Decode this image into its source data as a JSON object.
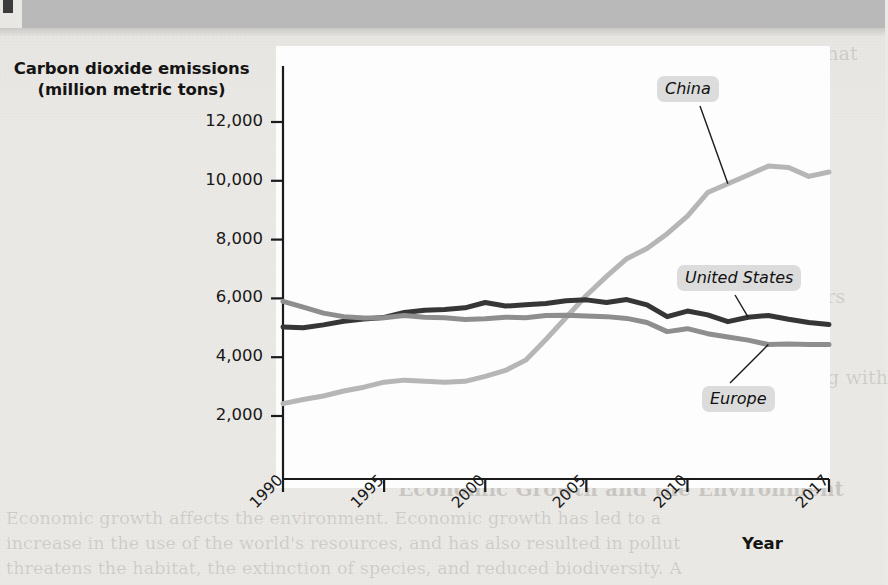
{
  "figure": {
    "y_axis_title": "Carbon dioxide emissions\n(million metric tons)",
    "y_axis_title_line1": "Carbon dioxide emissions",
    "y_axis_title_line2": "(million metric tons)",
    "x_axis_title": "Year"
  },
  "chart_data": {
    "type": "line",
    "title": "",
    "xlabel": "Year",
    "ylabel": "Carbon dioxide emissions (million metric tons)",
    "xlim": [
      1990,
      2017
    ],
    "ylim": [
      0,
      13000
    ],
    "yticks": [
      2000,
      4000,
      6000,
      8000,
      10000,
      12000
    ],
    "ytick_labels": [
      "2,000",
      "4,000",
      "6,000",
      "8,000",
      "10,000",
      "12,000"
    ],
    "xticks": [
      1990,
      1995,
      2000,
      2005,
      2010,
      2017
    ],
    "xtick_labels": [
      "1990",
      "1995",
      "2000",
      "2005",
      "2010",
      "2017"
    ],
    "grid": false,
    "legend_position": "inline-callouts",
    "x": [
      1990,
      1991,
      1992,
      1993,
      1994,
      1995,
      1996,
      1997,
      1998,
      1999,
      2000,
      2001,
      2002,
      2003,
      2004,
      2005,
      2006,
      2007,
      2008,
      2009,
      2010,
      2011,
      2012,
      2013,
      2014,
      2015,
      2016,
      2017
    ],
    "series": [
      {
        "name": "China",
        "color": "#b6b6b6",
        "values": [
          2420,
          2560,
          2680,
          2850,
          2980,
          3150,
          3220,
          3180,
          3150,
          3180,
          3350,
          3550,
          3900,
          4600,
          5350,
          6100,
          6750,
          7350,
          7700,
          8200,
          8800,
          9600,
          9900,
          10200,
          10500,
          10450,
          10150,
          10300
        ]
      },
      {
        "name": "United States",
        "color": "#363636",
        "values": [
          5030,
          5000,
          5100,
          5220,
          5300,
          5350,
          5520,
          5600,
          5620,
          5680,
          5860,
          5740,
          5780,
          5830,
          5920,
          5950,
          5860,
          5960,
          5780,
          5380,
          5570,
          5440,
          5210,
          5360,
          5420,
          5290,
          5180,
          5110
        ]
      },
      {
        "name": "Europe",
        "color": "#8e8e8e",
        "values": [
          5900,
          5700,
          5500,
          5380,
          5330,
          5340,
          5420,
          5360,
          5340,
          5280,
          5310,
          5360,
          5340,
          5420,
          5430,
          5400,
          5380,
          5320,
          5180,
          4870,
          4970,
          4800,
          4690,
          4580,
          4430,
          4450,
          4430,
          4430
        ]
      }
    ],
    "annotations": [
      {
        "text": "China",
        "series": "China",
        "point_year": 2012
      },
      {
        "text": "United States",
        "series": "United States",
        "point_year": 2013
      },
      {
        "text": "Europe",
        "series": "Europe",
        "point_year": 2014
      }
    ]
  },
  "labels": {
    "china": "China",
    "united_states": "United States",
    "europe": "Europe"
  },
  "ghost_text": {
    "lines": [
      "Most, though not all, economists believe that",
      "es and seeks to limit potential harm to the",
      "ant contribution to the task that requires",
      "we have little reason to expect a world",
      "al that there are no examples of forests,",
      "mic systems in most industrialized nations",
      "or systems that are off the path of sustain-",
      "are now in place in most industrialized",
      "in place in many less developed countries",
      "still a reversible problem, though researchers",
      "fear that a series of tipping points may soon",
      "and that certain kinds of environmental",
      "lves quite difficult to correct, such as dealing with",
      "the risk of nuclear accidents"
    ],
    "bottom_heading": "Economic Growth and the Environment",
    "bottom_lines": [
      "Economic growth affects the environment. Economic growth has led to a",
      "increase in the use of the world's resources, and has also resulted in pollut",
      "threatens the habitat, the extinction of species, and reduced biodiversity. A"
    ]
  }
}
